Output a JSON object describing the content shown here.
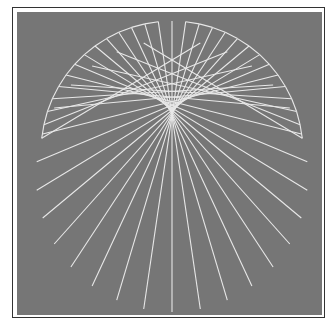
{
  "figure": {
    "background": "#ffffff",
    "frame_color": "#333333",
    "panel_color": "#767676",
    "line_color": "#e8e8e8",
    "line_width": 1.1
  },
  "construction": {
    "type": "string-art cardioid caustic",
    "start_circle": {
      "cx": 172,
      "cy": 152,
      "r": 131
    },
    "end_circle": {
      "cx": 172,
      "cy": 176,
      "r": 136
    },
    "rule": "line k joins angle t on start circle to angle 2t on end circle (angles from bottom)",
    "t_start_deg": 96,
    "t_end_deg": 264,
    "step_deg": 6,
    "top_gap_deg": 6
  }
}
